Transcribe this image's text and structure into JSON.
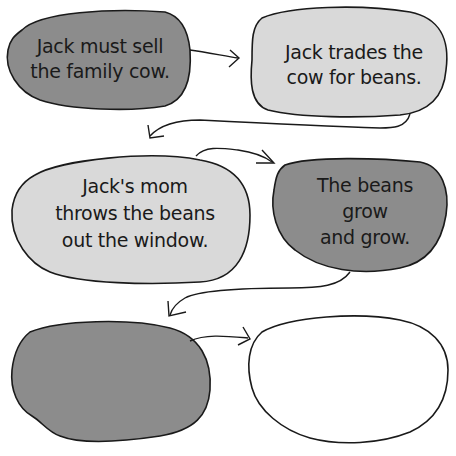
{
  "diagram": {
    "type": "sequence-chain",
    "colors": {
      "dark_gray": "#8c8c8c",
      "light_gray": "#d9d9d9",
      "white": "#ffffff",
      "outline": "#1a1a1a"
    },
    "steps": [
      {
        "id": 1,
        "fill": "dark",
        "lines": [
          "Jack must sell",
          "the family cow."
        ]
      },
      {
        "id": 2,
        "fill": "light",
        "lines": [
          "Jack trades the",
          "cow for beans."
        ]
      },
      {
        "id": 3,
        "fill": "light",
        "lines": [
          "Jack's mom",
          "throws the beans",
          "out the window."
        ]
      },
      {
        "id": 4,
        "fill": "dark",
        "lines": [
          "The beans",
          "grow",
          "and grow."
        ]
      },
      {
        "id": 5,
        "fill": "dark",
        "lines": []
      },
      {
        "id": 6,
        "fill": "white",
        "lines": []
      }
    ]
  }
}
